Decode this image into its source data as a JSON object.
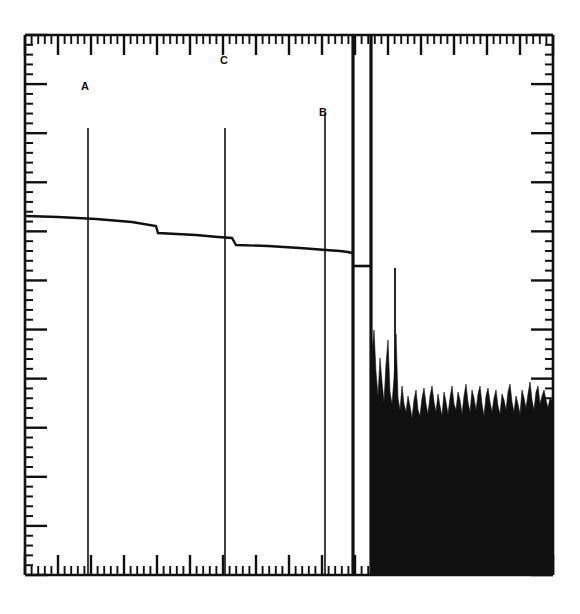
{
  "figure": {
    "kind": "spectrum-analyzer-trace",
    "background_color": "#ffffff",
    "ink_color": "#101010",
    "title": "",
    "caption": ""
  },
  "markers": [
    {
      "id": "marker-a",
      "label": "A",
      "x": 88,
      "y": 86
    },
    {
      "id": "marker-b",
      "label": "B",
      "x": 325,
      "y": 113
    },
    {
      "id": "marker-c",
      "label": "C",
      "x": 225,
      "y": 61
    }
  ],
  "chart_data": {
    "type": "line",
    "title": "",
    "subtitle": "",
    "xlabel": "",
    "ylabel": "",
    "grid": false,
    "legend": "none",
    "xlim": [
      0,
      100
    ],
    "ylim": [
      0,
      100
    ],
    "axes": {
      "frame": {
        "left": 25,
        "top": 35,
        "right": 553,
        "bottom": 575
      },
      "ticks_inward": true,
      "top": {
        "minor_count": 80,
        "major_every": 5,
        "minor_len": 9,
        "major_len": 20
      },
      "bottom": {
        "minor_count": 80,
        "major_every": 5,
        "minor_len": 9,
        "major_len": 20
      },
      "left": {
        "minor_count": 55,
        "major_every": 5,
        "minor_len": 8,
        "major_len": 22
      },
      "right": {
        "minor_count": 55,
        "major_every": 5,
        "minor_len": 8,
        "major_len": 22
      }
    },
    "baseline_trace": {
      "name": "carrier skirt baseline",
      "comment": "slowly descending trace from left frame edge to the large spike cluster, with small step discontinuities",
      "points": [
        [
          26,
          216
        ],
        [
          58,
          217
        ],
        [
          96,
          219
        ],
        [
          132,
          222
        ],
        [
          156,
          226
        ],
        [
          158,
          233
        ],
        [
          196,
          235
        ],
        [
          218,
          237
        ],
        [
          232,
          238
        ],
        [
          236,
          245
        ],
        [
          268,
          246
        ],
        [
          300,
          248
        ],
        [
          326,
          250
        ],
        [
          340,
          251
        ],
        [
          348,
          252
        ],
        [
          352,
          253
        ]
      ]
    },
    "plateau": {
      "name": "inter-spike plateau",
      "comment": "flat shelf linking the two tall spikes below their tops",
      "x_start": 352,
      "x_end": 372,
      "y": 266
    },
    "spikes": [
      {
        "name": "spike-A",
        "x": 88,
        "y_top": 128,
        "width": 1.6,
        "y_bottom": 575
      },
      {
        "name": "spike-mid",
        "x": 225,
        "y_top": 128,
        "width": 1.6,
        "y_bottom": 575
      },
      {
        "name": "spike-B",
        "x": 325,
        "y_top": 113,
        "width": 1.6,
        "y_bottom": 575
      },
      {
        "name": "spike-carrier-1",
        "x": 353,
        "y_top": 36,
        "width": 3.2,
        "y_bottom": 575
      },
      {
        "name": "spike-carrier-2",
        "x": 371,
        "y_top": 36,
        "width": 3.2,
        "y_bottom": 575
      },
      {
        "name": "spike-sideband",
        "x": 395,
        "y_top": 268,
        "width": 1.8,
        "y_bottom": 575
      }
    ],
    "noise_floor": {
      "name": "noise floor",
      "comment": "dense solid black grass filling the right portion of the graticule",
      "x_start": 372,
      "x_end": 553,
      "solid_below_y": 428,
      "envelope": [
        [
          372,
          352
        ],
        [
          374,
          330
        ],
        [
          376,
          372
        ],
        [
          378,
          396
        ],
        [
          380,
          358
        ],
        [
          382,
          382
        ],
        [
          384,
          402
        ],
        [
          386,
          364
        ],
        [
          388,
          340
        ],
        [
          390,
          392
        ],
        [
          392,
          404
        ],
        [
          394,
          378
        ],
        [
          396,
          334
        ],
        [
          398,
          398
        ],
        [
          400,
          410
        ],
        [
          402,
          386
        ],
        [
          404,
          404
        ],
        [
          406,
          412
        ],
        [
          408,
          396
        ],
        [
          410,
          406
        ],
        [
          412,
          418
        ],
        [
          414,
          400
        ],
        [
          416,
          390
        ],
        [
          418,
          410
        ],
        [
          420,
          416
        ],
        [
          422,
          398
        ],
        [
          424,
          388
        ],
        [
          426,
          404
        ],
        [
          428,
          414
        ],
        [
          430,
          396
        ],
        [
          432,
          386
        ],
        [
          434,
          402
        ],
        [
          436,
          412
        ],
        [
          438,
          394
        ],
        [
          440,
          406
        ],
        [
          442,
          416
        ],
        [
          444,
          392
        ],
        [
          446,
          402
        ],
        [
          448,
          414
        ],
        [
          450,
          398
        ],
        [
          452,
          386
        ],
        [
          454,
          404
        ],
        [
          456,
          410
        ],
        [
          458,
          392
        ],
        [
          460,
          400
        ],
        [
          462,
          414
        ],
        [
          464,
          396
        ],
        [
          466,
          384
        ],
        [
          468,
          402
        ],
        [
          470,
          412
        ],
        [
          472,
          390
        ],
        [
          474,
          398
        ],
        [
          476,
          410
        ],
        [
          478,
          394
        ],
        [
          480,
          386
        ],
        [
          482,
          404
        ],
        [
          484,
          416
        ],
        [
          486,
          396
        ],
        [
          488,
          388
        ],
        [
          490,
          402
        ],
        [
          492,
          412
        ],
        [
          494,
          398
        ],
        [
          496,
          390
        ],
        [
          498,
          406
        ],
        [
          500,
          414
        ],
        [
          502,
          394
        ],
        [
          504,
          400
        ],
        [
          506,
          410
        ],
        [
          508,
          392
        ],
        [
          510,
          384
        ],
        [
          512,
          402
        ],
        [
          514,
          412
        ],
        [
          516,
          396
        ],
        [
          518,
          404
        ],
        [
          520,
          414
        ],
        [
          522,
          390
        ],
        [
          524,
          398
        ],
        [
          526,
          408
        ],
        [
          528,
          394
        ],
        [
          530,
          382
        ],
        [
          532,
          400
        ],
        [
          534,
          410
        ],
        [
          536,
          392
        ],
        [
          538,
          386
        ],
        [
          540,
          404
        ],
        [
          542,
          396
        ],
        [
          544,
          390
        ],
        [
          546,
          400
        ],
        [
          548,
          408
        ],
        [
          550,
          398
        ],
        [
          553,
          402
        ]
      ]
    }
  }
}
